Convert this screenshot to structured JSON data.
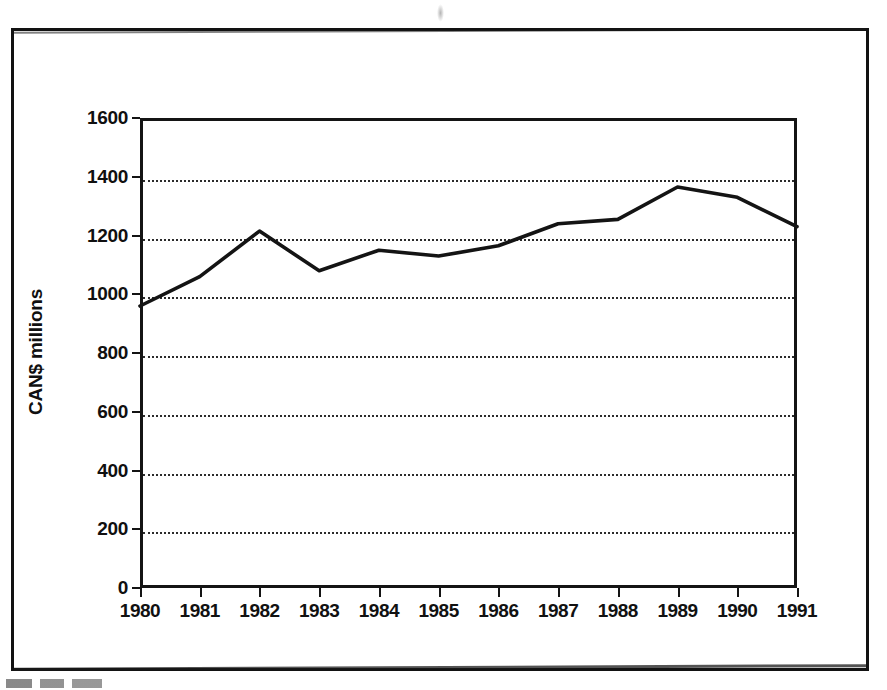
{
  "chart_data": {
    "type": "line",
    "title": "",
    "subtitle": "",
    "xlabel": "",
    "ylabel": "CAN$ millions",
    "categories": [
      "1980",
      "1981",
      "1982",
      "1983",
      "1984",
      "1985",
      "1986",
      "1987",
      "1988",
      "1989",
      "1990",
      "1991"
    ],
    "x": [
      1980,
      1981,
      1982,
      1983,
      1984,
      1985,
      1986,
      1987,
      1988,
      1989,
      1990,
      1991
    ],
    "values": [
      960,
      1060,
      1215,
      1080,
      1150,
      1130,
      1165,
      1240,
      1255,
      1365,
      1330,
      1230
    ],
    "series": [
      {
        "name": "CAN$ millions",
        "values": [
          960,
          1060,
          1215,
          1080,
          1150,
          1130,
          1165,
          1240,
          1255,
          1365,
          1330,
          1230
        ]
      }
    ],
    "ylim": [
      0,
      1600
    ],
    "yticks": [
      0,
      200,
      400,
      600,
      800,
      1000,
      1200,
      1400,
      1600
    ],
    "ytick_labels": [
      "0",
      "200",
      "400",
      "600",
      "800",
      "1000",
      "1200",
      "1400",
      "1600"
    ],
    "xtick_labels": [
      "1980",
      "1981",
      "1982",
      "1983",
      "1984",
      "1985",
      "1986",
      "1987",
      "1988",
      "1989",
      "1990",
      "1991"
    ],
    "grid": "horizontal-dotted",
    "legend": "none",
    "line_color": "#141414",
    "background_color": "#ffffff",
    "frame": "full-box"
  },
  "figure": {
    "border_color": "#121212",
    "caption": ""
  }
}
